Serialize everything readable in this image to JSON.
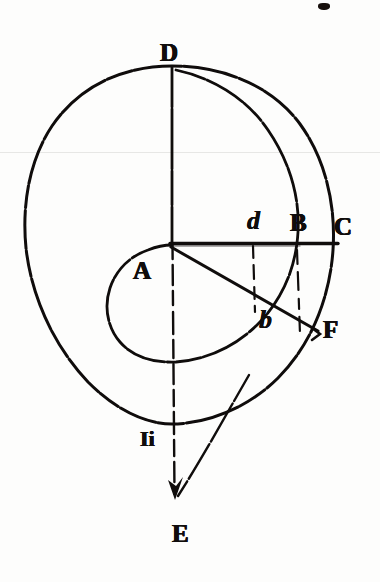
{
  "figure": {
    "kind": "geometric-spiral-diagram",
    "ink_color": "#100d0c",
    "paper_color": "#fdfdfc",
    "labels": [
      {
        "id": "D",
        "text": "D",
        "style": "cap",
        "x": 160,
        "y": 40,
        "role": "top-point-of-outer-circle"
      },
      {
        "id": "d",
        "text": "d",
        "style": "ital",
        "x": 247,
        "y": 208,
        "role": "intersection-inner-spiral-with-radius"
      },
      {
        "id": "B",
        "text": "B",
        "style": "cap",
        "x": 290,
        "y": 210,
        "role": "point-on-outer-circle-right"
      },
      {
        "id": "C",
        "text": "C",
        "style": "cap",
        "x": 334,
        "y": 214,
        "role": "end-of-horizontal-radius"
      },
      {
        "id": "A",
        "text": "A",
        "style": "cap",
        "x": 133,
        "y": 258,
        "role": "center-point"
      },
      {
        "id": "b",
        "text": "b",
        "style": "ital",
        "x": 259,
        "y": 307,
        "role": "point-on-line-AF"
      },
      {
        "id": "F",
        "text": "F",
        "style": "cap",
        "x": 323,
        "y": 317,
        "role": "end-of-oblique-radius"
      },
      {
        "id": "Ii",
        "text": "Ii",
        "style": "cap",
        "x": 140,
        "y": 428,
        "role": "bottom-point-of-outer-circle"
      },
      {
        "id": "E",
        "text": "E",
        "style": "cap",
        "x": 172,
        "y": 521,
        "role": "arrowhead-terminus-below-figure"
      }
    ],
    "geometry": {
      "center": {
        "x": 172,
        "y": 243,
        "label": "A"
      },
      "outer_circle": {
        "cx": 172,
        "cy": 243,
        "r": 178,
        "stroke": "#100d0c",
        "stroke_width": 3
      },
      "horizontal_radius": {
        "from": "A",
        "to": "C",
        "x1": 172,
        "y1": 243,
        "x2": 338,
        "y2": 243
      },
      "vertical_axis": {
        "from": "D",
        "to": "E",
        "x1": 172,
        "y1": 67,
        "x2": 172,
        "y2": 500,
        "dashed_below_center": true
      },
      "oblique_radius": {
        "from": "A",
        "to": "F",
        "x1": 172,
        "y1": 248,
        "x2": 318,
        "y2": 330
      },
      "inner_spiral": {
        "from": "D",
        "through": [
          "d",
          "b"
        ],
        "to": "A",
        "description": "archimedean-like spiral winding inward from D to A"
      },
      "dashed_drop_from_d": {
        "x": 253,
        "y1": 243,
        "y2": 312
      },
      "dashed_drop_from_B": {
        "x": 297,
        "y1": 247,
        "y2": 330
      },
      "arrow_to_E": {
        "tip_x": 175,
        "tip_y": 497
      },
      "pointer_line": {
        "x1": 246,
        "y1": 380,
        "x2": 176,
        "y2": 498
      }
    }
  },
  "artifacts": {
    "scan_line_y": 152,
    "top_edge_mark": {
      "x": 318,
      "y": 3,
      "w": 12,
      "h": 7
    }
  }
}
